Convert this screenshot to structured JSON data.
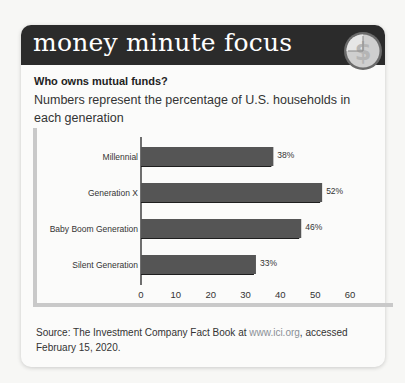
{
  "header": {
    "title": "money minute focus",
    "icon": "clock-dollar-icon"
  },
  "question": "Who owns mutual funds?",
  "subtitle": "Numbers represent the percentage of U.S. households in each generation",
  "source": {
    "prefix": "Source: The Investment Company Fact Book at ",
    "link": "www.ici.org",
    "suffix": ", accessed February 15, 2020."
  },
  "chart_data": {
    "type": "bar",
    "orientation": "horizontal",
    "title": "Who owns mutual funds?",
    "subtitle": "Numbers represent the percentage of U.S. households in each generation",
    "categories": [
      "Millennial",
      "Generation X",
      "Baby Boom Generation",
      "Silent Generation"
    ],
    "values": [
      38,
      52,
      46,
      33
    ],
    "value_labels": [
      "38%",
      "52%",
      "46%",
      "33%"
    ],
    "xlabel": "",
    "ylabel": "",
    "xlim": [
      0,
      60
    ],
    "xticks": [
      0,
      10,
      20,
      30,
      40,
      50,
      60
    ],
    "grid": false,
    "legend": null,
    "bar_color": "#555555",
    "shadow_color": "#1e1e1e"
  }
}
